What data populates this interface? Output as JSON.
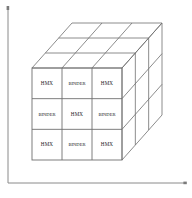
{
  "figure": {
    "title": "",
    "background_color": "#ffffff",
    "line_color": "#6f6f6f",
    "axis_color": "#8a8a8a",
    "text_color": "#1a1a1a"
  },
  "axes": {
    "vertical_axis_label": "",
    "horizontal_axis_label": "",
    "origin_x": 8,
    "origin_y": 183,
    "vertical_top_y": 8,
    "horizontal_right_x": 186
  },
  "cube": {
    "rows": 3,
    "columns": 3,
    "depth_layers": 3,
    "front_left_x": 32,
    "front_top_y": 68,
    "front_right_x": 122,
    "front_bottom_y": 160,
    "depth_dx": 40,
    "depth_dy": -45
  },
  "materials": {
    "hmx": "HMX",
    "binder": "BINDER"
  },
  "front_face": {
    "grid": [
      [
        "HMX",
        "BINDER",
        "HMX"
      ],
      [
        "BINDER",
        "HMX",
        "BINDER"
      ],
      [
        "HMX",
        "BINDER",
        "HMX"
      ]
    ],
    "cells": [
      {
        "row": 0,
        "col": 0,
        "label": "HMX"
      },
      {
        "row": 0,
        "col": 1,
        "label": "BINDER"
      },
      {
        "row": 0,
        "col": 2,
        "label": "HMX"
      },
      {
        "row": 1,
        "col": 0,
        "label": "BINDER"
      },
      {
        "row": 1,
        "col": 1,
        "label": "HMX"
      },
      {
        "row": 1,
        "col": 2,
        "label": "BINDER"
      },
      {
        "row": 2,
        "col": 0,
        "label": "HMX"
      },
      {
        "row": 2,
        "col": 1,
        "label": "BINDER"
      },
      {
        "row": 2,
        "col": 2,
        "label": "HMX"
      }
    ]
  }
}
